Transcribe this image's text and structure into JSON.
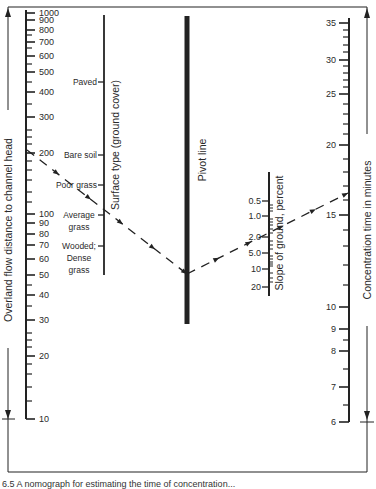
{
  "chart_data": {
    "type": "nomograph",
    "title": "",
    "colors": {
      "ink": "#222222",
      "paper": "#ffffff"
    },
    "frame": {
      "x1": 8,
      "y1": 7,
      "x2": 367,
      "y2": 472
    },
    "overland_flow_axis": {
      "title": "Overland flow distance to channel head",
      "scale": "log",
      "x": 26,
      "y_top": 10,
      "y_bottom": 419,
      "major_ticks": [
        {
          "value": 1000,
          "label": "1000",
          "y": 13
        },
        {
          "value": 900,
          "label": "900",
          "y": 20
        },
        {
          "value": 800,
          "label": "800",
          "y": 30
        },
        {
          "value": 700,
          "label": "700",
          "y": 42
        },
        {
          "value": 600,
          "label": "600",
          "y": 56
        },
        {
          "value": 500,
          "label": "500",
          "y": 72
        },
        {
          "value": 400,
          "label": "400",
          "y": 92
        },
        {
          "value": 300,
          "label": "300",
          "y": 117
        },
        {
          "value": 200,
          "label": "200",
          "y": 153
        },
        {
          "value": 100,
          "label": "100",
          "y": 214
        },
        {
          "value": 90,
          "label": "90",
          "y": 223
        },
        {
          "value": 80,
          "label": "80",
          "y": 234
        },
        {
          "value": 70,
          "label": "70",
          "y": 245
        },
        {
          "value": 60,
          "label": "60",
          "y": 259
        },
        {
          "value": 50,
          "label": "50",
          "y": 275
        },
        {
          "value": 40,
          "label": "40",
          "y": 295
        },
        {
          "value": 30,
          "label": "30",
          "y": 320
        },
        {
          "value": 20,
          "label": "20",
          "y": 356
        },
        {
          "value": 10,
          "label": "10",
          "y": 419
        }
      ],
      "minor_ticks_y": [
        35,
        48,
        64,
        82,
        104,
        130,
        137,
        144,
        161,
        170,
        180,
        192,
        202,
        285,
        306,
        333,
        340,
        347,
        364,
        374,
        387,
        401
      ]
    },
    "surface_type_axis": {
      "title": "Surface type (ground cover)",
      "x": 104,
      "y_top": 15,
      "y_bottom": 275,
      "entries": [
        {
          "label_lines": [
            "Paved"
          ],
          "y": 82
        },
        {
          "label_lines": [
            "Bare soil"
          ],
          "y": 155
        },
        {
          "label_lines": [
            "Poor grass"
          ],
          "y": 185
        },
        {
          "label_lines": [
            "Average",
            "grass"
          ],
          "y": 215
        },
        {
          "label_lines": [
            "Wooded;",
            "Dense",
            "grass"
          ],
          "y": 246
        }
      ]
    },
    "pivot_line": {
      "title": "Pivot line",
      "x": 187,
      "y_top": 16,
      "y_bottom": 324
    },
    "slope_axis": {
      "title": "Slope of ground, percent",
      "scale": "log",
      "x": 269,
      "y_top": 172,
      "y_bottom": 296,
      "major_ticks": [
        {
          "value": 0.5,
          "label": "0.5",
          "y": 201
        },
        {
          "value": 1.0,
          "label": "1.0",
          "y": 216
        },
        {
          "value": 2.0,
          "label": "2.0",
          "y": 237
        },
        {
          "value": 5.0,
          "label": "5.0",
          "y": 253
        },
        {
          "value": 10,
          "label": "10",
          "y": 269
        },
        {
          "value": 20,
          "label": "20",
          "y": 287
        }
      ],
      "minor_ticks_y": [
        205,
        208,
        211,
        219,
        222,
        225,
        229,
        233,
        241,
        245,
        249,
        256,
        259,
        262,
        264,
        266,
        273,
        278,
        282
      ]
    },
    "concentration_time_axis": {
      "title": "Concentration time in minutes",
      "scale": "log",
      "x": 349,
      "y_top": 18,
      "y_bottom": 422,
      "major_ticks": [
        {
          "value": 35,
          "label": "35",
          "y": 23
        },
        {
          "value": 30,
          "label": "30",
          "y": 60
        },
        {
          "value": 25,
          "label": "25",
          "y": 94
        },
        {
          "value": 20,
          "label": "20",
          "y": 145
        },
        {
          "value": 15,
          "label": "15",
          "y": 215
        },
        {
          "value": 10,
          "label": "10",
          "y": 307
        },
        {
          "value": 9,
          "label": "9",
          "y": 329
        },
        {
          "value": 8,
          "label": "8",
          "y": 351
        },
        {
          "value": 7,
          "label": "7",
          "y": 387
        },
        {
          "value": 6,
          "label": "6",
          "y": 422
        }
      ],
      "minor_ticks_y": [
        30,
        37,
        45,
        52,
        66,
        73,
        80,
        87,
        104,
        114,
        124,
        134,
        159,
        172,
        186,
        200,
        230,
        246,
        265,
        285,
        340,
        369,
        405
      ]
    },
    "example_path": {
      "description": "Dashed example: ~200 distance, average grass, pivot, ~2% slope, ~16 min",
      "segments": [
        {
          "x1": 27,
          "y1": 150,
          "x2": 187,
          "y2": 274
        },
        {
          "x1": 187,
          "y1": 274,
          "x2": 348,
          "y2": 193
        }
      ]
    },
    "arrows": {
      "left": {
        "x": 8,
        "y_top": 22,
        "y_bottom": 418,
        "label_y_center": 230
      },
      "right": {
        "x": 367,
        "y_top": 22,
        "y_bottom": 420,
        "label_y_center": 230
      }
    },
    "caption": "6.5   A nomograph for estimating the time of concentration..."
  }
}
